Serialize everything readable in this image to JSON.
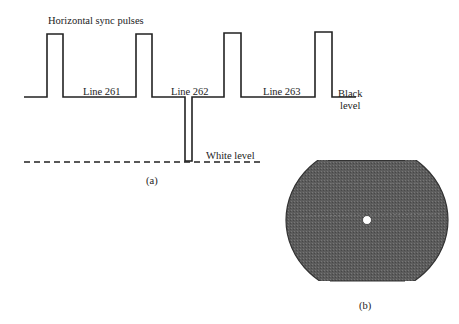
{
  "part_a": {
    "title": "Horizontal sync pulses",
    "segment_labels": [
      "Line 261",
      "Line 262",
      "Line 263"
    ],
    "black_level_line1": "Black",
    "black_level_line2": "level",
    "white_level": "White level",
    "caption": "(a)"
  },
  "part_b": {
    "caption": "(b)",
    "fill_color": "#5a5a5a"
  }
}
